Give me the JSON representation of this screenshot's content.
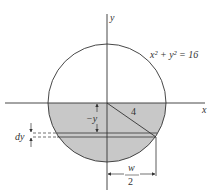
{
  "figure": {
    "equation_label": "x² + y² = 16",
    "x_axis_label": "x",
    "y_axis_label": "y",
    "radius_label": "4",
    "depth_label": "−y",
    "strip_thickness_label": "dy",
    "half_width_numerator": "w",
    "half_width_denominator": "2",
    "colors": {
      "fill": "#c8c8c8",
      "stroke": "#333333",
      "background": "#ffffff"
    }
  }
}
